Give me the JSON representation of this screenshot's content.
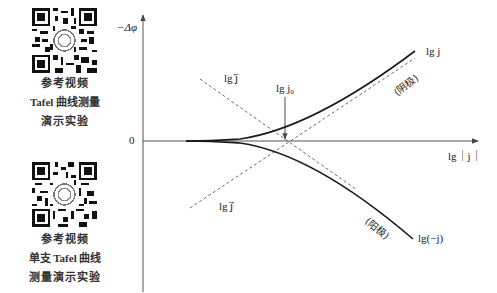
{
  "sidebar": {
    "qr1": {
      "icon": "qr-code-icon",
      "caption_line1": "参考视频",
      "caption_line2": "Tafel 曲线测量",
      "caption_line3": "演示实验"
    },
    "qr2": {
      "icon": "qr-code-icon",
      "caption_line1": "参考视频",
      "caption_line2": "单支 Tafel 曲线",
      "caption_line3": "测量演示实验"
    }
  },
  "diagram": {
    "y_axis_label": "−Δφ",
    "x_axis_label": "lg｜j｜",
    "origin_label": "0",
    "exchange_label": "lg j₀",
    "cathodic_partial_label": "lg j⃖",
    "anodic_partial_label": "lg j⃗",
    "cathode_curve_label": "lg j",
    "cathode_note": "(阴极)",
    "anode_curve_label": "lg(−j)",
    "anode_note": "(阳极)"
  },
  "colors": {
    "curve": "#1a1a1a",
    "axis": "#555555",
    "dashed": "#444444",
    "text": "#222222"
  }
}
